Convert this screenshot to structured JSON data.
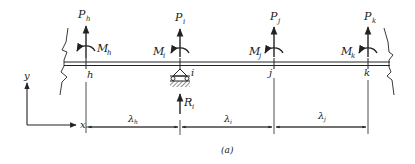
{
  "figure": {
    "caption": "(a)",
    "background": "#ffffff",
    "ink": "#222222"
  },
  "axes": {
    "x_label": "x",
    "y_label": "y"
  },
  "nodes": [
    {
      "id": "h",
      "label": "h",
      "force": {
        "P": "P",
        "sub": "h"
      },
      "moment": {
        "M": "M",
        "sub": "h"
      }
    },
    {
      "id": "i",
      "label": "i",
      "force": {
        "P": "P",
        "sub": "i"
      },
      "moment": {
        "M": "M",
        "sub": "i"
      }
    },
    {
      "id": "j",
      "label": "j",
      "force": {
        "P": "P",
        "sub": "j"
      },
      "moment": {
        "M": "M",
        "sub": "j"
      }
    },
    {
      "id": "k",
      "label": "k",
      "force": {
        "P": "P",
        "sub": "k"
      },
      "moment": {
        "M": "M",
        "sub": "k"
      }
    }
  ],
  "support": {
    "node": "i",
    "type": "roller",
    "reaction": {
      "R": "R",
      "sub": "i"
    }
  },
  "spans": [
    {
      "symbol": "λ",
      "sub": "h"
    },
    {
      "symbol": "λ",
      "sub": "i"
    },
    {
      "symbol": "λ",
      "sub": "j"
    }
  ]
}
